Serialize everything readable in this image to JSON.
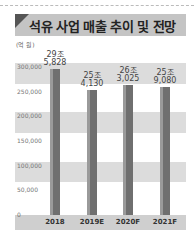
{
  "header": {
    "title": "석유 사업 매출 추이 및 전망"
  },
  "unit": "(억 원)",
  "chart_data": {
    "type": "bar",
    "title": "석유 사업 매출 추이 및 전망",
    "ylabel": "(억 원)",
    "xlabel": "",
    "categories": [
      "2018",
      "2019E",
      "2020F",
      "2021F"
    ],
    "values": [
      295828,
      254130,
      263025,
      259080
    ],
    "value_labels": [
      [
        "29조",
        "5,828"
      ],
      [
        "25조",
        "4,130"
      ],
      [
        "26조",
        "3,025"
      ],
      [
        "25조",
        "9,080"
      ]
    ],
    "yticks": [
      "0",
      "50,000",
      "100,000",
      "150,000",
      "200,000",
      "250,000",
      "300,000"
    ],
    "ylim": [
      0,
      300000
    ],
    "grid": "alternating bands",
    "legend": null
  },
  "colors": {
    "bar": "#6f6f6f",
    "band": "#dcdcdc",
    "header": "#c4c4c4"
  }
}
